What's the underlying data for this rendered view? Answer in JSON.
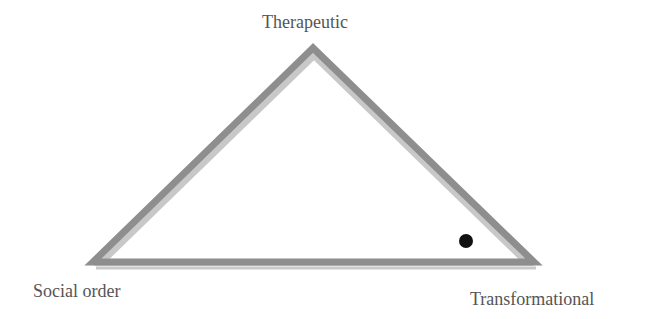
{
  "diagram": {
    "type": "triangle",
    "vertices": {
      "top": {
        "label": "Therapeutic"
      },
      "bottom_left": {
        "label": "Social order"
      },
      "bottom_right": {
        "label": "Transformational"
      }
    },
    "marker": {
      "shape": "dot",
      "position": "near bottom-right vertex, inside triangle",
      "color": "#111111"
    },
    "colors": {
      "outer_stroke": "#8c8c8c",
      "inner_stroke": "#c4c4c4",
      "label_text": "#555555",
      "background": "#ffffff"
    }
  }
}
